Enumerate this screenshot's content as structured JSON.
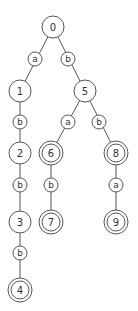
{
  "diagram": {
    "type": "trie / automaton tree",
    "nodes": [
      {
        "id": "0",
        "label": "0",
        "x": 53,
        "y": 27,
        "accepting": false
      },
      {
        "id": "1",
        "label": "1",
        "x": 20,
        "y": 91,
        "accepting": false
      },
      {
        "id": "2",
        "label": "2",
        "x": 20,
        "y": 153,
        "accepting": false
      },
      {
        "id": "3",
        "label": "3",
        "x": 20,
        "y": 222,
        "accepting": false
      },
      {
        "id": "4",
        "label": "4",
        "x": 20,
        "y": 290,
        "accepting": true
      },
      {
        "id": "5",
        "label": "5",
        "x": 85,
        "y": 91,
        "accepting": false
      },
      {
        "id": "6",
        "label": "6",
        "x": 51,
        "y": 153,
        "accepting": true
      },
      {
        "id": "7",
        "label": "7",
        "x": 51,
        "y": 222,
        "accepting": true
      },
      {
        "id": "8",
        "label": "8",
        "x": 116,
        "y": 153,
        "accepting": true
      },
      {
        "id": "9",
        "label": "9",
        "x": 116,
        "y": 222,
        "accepting": true
      }
    ],
    "edges": [
      {
        "from": "0",
        "to": "1",
        "symbol": "a",
        "lx": 35,
        "ly": 59
      },
      {
        "from": "0",
        "to": "5",
        "symbol": "b",
        "lx": 68,
        "ly": 59
      },
      {
        "from": "1",
        "to": "2",
        "symbol": "b",
        "lx": 20,
        "ly": 122
      },
      {
        "from": "2",
        "to": "3",
        "symbol": "b",
        "lx": 20,
        "ly": 185
      },
      {
        "from": "3",
        "to": "4",
        "symbol": "b",
        "lx": 20,
        "ly": 253
      },
      {
        "from": "5",
        "to": "6",
        "symbol": "a",
        "lx": 68,
        "ly": 122
      },
      {
        "from": "5",
        "to": "8",
        "symbol": "b",
        "lx": 99,
        "ly": 122
      },
      {
        "from": "6",
        "to": "7",
        "symbol": "b",
        "lx": 51,
        "ly": 185
      },
      {
        "from": "8",
        "to": "9",
        "symbol": "a",
        "lx": 116,
        "ly": 185
      }
    ]
  }
}
